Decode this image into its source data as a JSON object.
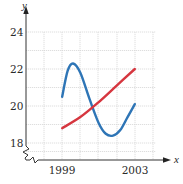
{
  "chart_data": {
    "type": "line",
    "title": "",
    "xlabel": "x",
    "ylabel": "y",
    "xlim": [
      1998,
      2004
    ],
    "ylim": [
      18,
      24
    ],
    "grid": true,
    "axis_break_y": true,
    "x_ticks": [
      {
        "value": 1999,
        "label": "1999"
      },
      {
        "value": 2003,
        "label": "2003"
      }
    ],
    "y_ticks": [
      {
        "value": 18,
        "label": "18"
      },
      {
        "value": 20,
        "label": "20"
      },
      {
        "value": 22,
        "label": "22"
      },
      {
        "value": 24,
        "label": "24"
      }
    ],
    "series": [
      {
        "name": "blue-curve",
        "color": "#2e75b6",
        "shape": "sinusoidal",
        "x": [
          1999.0,
          1999.3,
          1999.6,
          2000.0,
          2000.5,
          2001.0,
          2001.4,
          2001.8,
          2002.2,
          2002.6,
          2003.0
        ],
        "y": [
          20.5,
          21.9,
          22.3,
          21.8,
          20.4,
          19.1,
          18.5,
          18.4,
          18.7,
          19.4,
          20.1
        ]
      },
      {
        "name": "red-line",
        "color": "#d6363f",
        "shape": "slightly-convex increasing",
        "x": [
          1999.0,
          2000.0,
          2001.0,
          2002.0,
          2003.0
        ],
        "y": [
          18.8,
          19.4,
          20.2,
          21.1,
          22.0
        ]
      }
    ]
  },
  "labels": {
    "x_axis": "x",
    "y_axis": "y",
    "x_tick_1999": "1999",
    "x_tick_2003": "2003",
    "y_tick_24": "24",
    "y_tick_22": "22",
    "y_tick_20": "20",
    "y_tick_18": "18"
  }
}
